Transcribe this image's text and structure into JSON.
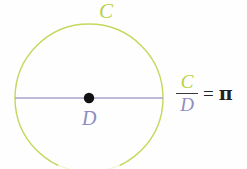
{
  "figure": {
    "background_color": "#fefefe"
  },
  "labels": {
    "circumference": "C",
    "diameter": "D"
  },
  "formula": {
    "numerator": "C",
    "denominator": "D",
    "equals": "=",
    "result": "π",
    "plain_text": "C/D = π"
  },
  "colors": {
    "circle_stroke": "#c3d85c",
    "circumference_label": "#b9d14a",
    "diameter_line": "#a7a3cc",
    "diameter_label": "#8f8cc0",
    "center_dot": "#111111",
    "equals_and_pi": "#222222",
    "fraction_bar": "#3a3a3a"
  },
  "geometry": {
    "canvas_width": 247,
    "canvas_height": 169,
    "center_x": 89,
    "center_y": 98,
    "radius": 74,
    "circle_stroke_width": 1.4,
    "diameter_line_y": 98,
    "diameter_line_x1": 15,
    "diameter_line_x2": 163,
    "center_dot_radius": 5.2
  }
}
